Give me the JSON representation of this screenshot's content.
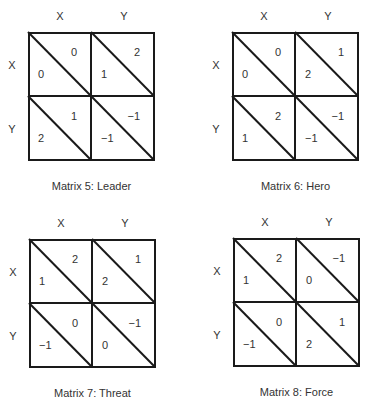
{
  "matrices": [
    {
      "caption": "Matrix 5: Leader",
      "col_labels": [
        "X",
        "Y"
      ],
      "row_labels": [
        "X",
        "Y"
      ],
      "cells": [
        [
          {
            "row_payoff": "0",
            "col_payoff": "0"
          },
          {
            "row_payoff": "1",
            "col_payoff": "2"
          }
        ],
        [
          {
            "row_payoff": "2",
            "col_payoff": "1"
          },
          {
            "row_payoff": "−1",
            "col_payoff": "−1"
          }
        ]
      ]
    },
    {
      "caption": "Matrix 6: Hero",
      "col_labels": [
        "X",
        "Y"
      ],
      "row_labels": [
        "X",
        "Y"
      ],
      "cells": [
        [
          {
            "row_payoff": "0",
            "col_payoff": "0"
          },
          {
            "row_payoff": "2",
            "col_payoff": "1"
          }
        ],
        [
          {
            "row_payoff": "1",
            "col_payoff": "2"
          },
          {
            "row_payoff": "−1",
            "col_payoff": "−1"
          }
        ]
      ]
    },
    {
      "caption": "Matrix 7: Threat",
      "col_labels": [
        "X",
        "Y"
      ],
      "row_labels": [
        "X",
        "Y"
      ],
      "cells": [
        [
          {
            "row_payoff": "1",
            "col_payoff": "2"
          },
          {
            "row_payoff": "2",
            "col_payoff": "1"
          }
        ],
        [
          {
            "row_payoff": "−1",
            "col_payoff": "0"
          },
          {
            "row_payoff": "0",
            "col_payoff": "−1"
          }
        ]
      ]
    },
    {
      "caption": "Matrix 8: Force",
      "col_labels": [
        "X",
        "Y"
      ],
      "row_labels": [
        "X",
        "Y"
      ],
      "cells": [
        [
          {
            "row_payoff": "1",
            "col_payoff": "2"
          },
          {
            "row_payoff": "0",
            "col_payoff": "−1"
          }
        ],
        [
          {
            "row_payoff": "−1",
            "col_payoff": "0"
          },
          {
            "row_payoff": "2",
            "col_payoff": "1"
          }
        ]
      ]
    }
  ]
}
